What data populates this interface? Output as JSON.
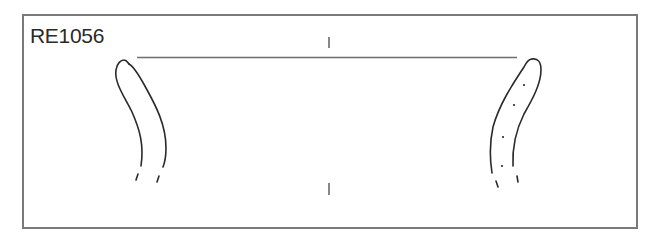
{
  "figure": {
    "label": "RE1056",
    "type": "pottery rim profile drawing",
    "colors": {
      "frame": "#7a7a7a",
      "line": "#2a2a2a",
      "rim_line": "#6e6e6e"
    },
    "elements": {
      "rim_line": "horizontal rim diameter line",
      "center_axis_ticks": 2,
      "left_profile": "section profile (left)",
      "right_profile": "section profile (right, with dotted interior)"
    }
  }
}
